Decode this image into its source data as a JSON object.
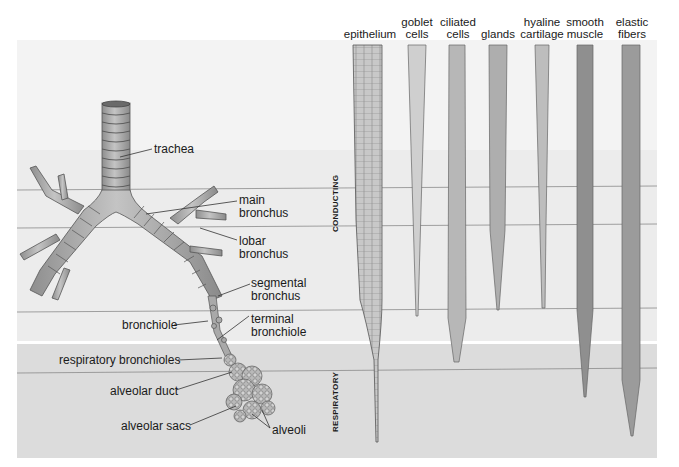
{
  "figure": {
    "zones": {
      "conducting": "CONDUCTING",
      "respiratory": "RESPIRATORY"
    },
    "airway_labels": {
      "trachea": "trachea",
      "main_bronchus": [
        "main",
        "bronchus"
      ],
      "lobar_bronchus": [
        "lobar",
        "bronchus"
      ],
      "segmental_bronchus": [
        "segmental",
        "bronchus"
      ],
      "bronchiole": "bronchiole",
      "terminal_bronchiole": [
        "terminal",
        "bronchiole"
      ],
      "respiratory_bronchioles": "respiratory bronchioles",
      "alveolar_duct": "alveolar duct",
      "alveolar_sacs": "alveolar sacs",
      "alveoli": "alveoli"
    },
    "column_headers": [
      {
        "key": "epithelium",
        "lines": [
          "epithelium"
        ]
      },
      {
        "key": "goblet_cells",
        "lines": [
          "goblet",
          "cells"
        ]
      },
      {
        "key": "ciliated_cells",
        "lines": [
          "ciliated",
          "cells"
        ]
      },
      {
        "key": "glands",
        "lines": [
          "glands"
        ]
      },
      {
        "key": "hyaline_cartilage",
        "lines": [
          "hyaline",
          "cartilage"
        ]
      },
      {
        "key": "smooth_muscle",
        "lines": [
          "smooth",
          "muscle"
        ]
      },
      {
        "key": "elastic_fibers",
        "lines": [
          "elastic",
          "fibers"
        ]
      }
    ],
    "colors": {
      "conducting_bg": "#ececec",
      "respiratory_bg": "#dcdcdc",
      "divider": "#ffffff",
      "grid_line": "#8a8a8a",
      "airway_fill": "#a9a9a9",
      "airway_stroke": "#555555",
      "goblet": "#cfcfcf",
      "ciliated": "#b7b7b7",
      "glands": "#aeaeae",
      "cartilage": "#bdbdbd",
      "smooth_muscle": "#8f8f8f",
      "elastic": "#9b9b9b"
    }
  }
}
